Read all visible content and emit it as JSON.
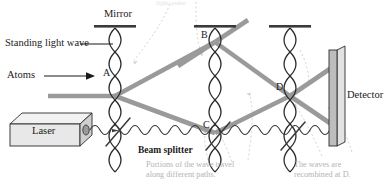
{
  "figure": {
    "kind": "atom-interferometer-diagram",
    "top_caption_partial": "light-pulse",
    "labels": {
      "mirror": "Mirror",
      "standing_light_wave": "Standing light wave",
      "atoms": "Atoms",
      "laser": "Laser",
      "beam_splitter": "Beam splitter",
      "detector": "Detector",
      "point_a": "A",
      "point_b": "B",
      "point_c": "C",
      "point_d": "D"
    },
    "captions": {
      "left": "Portions of the wave travel\nalong different paths.",
      "left_line1": "Portions of the wave travel",
      "left_line2": "along different paths.",
      "right": "The waves are\nrecombined at D.",
      "right_line1": "The waves are",
      "right_line2": "recombined at D."
    },
    "colors": {
      "atom_beam": "#9a9a9a",
      "standing_wave": "#2b2b2b",
      "mirror_bar": "#3a3a3a",
      "laser_wave": "#3a3a3a",
      "detector_fill": "#bdbdbd",
      "laser_fill": "#e8e8e8",
      "caption_gray": "#b3b3b3",
      "leader_gray": "#cfcfcf",
      "text": "#1a1a1a"
    },
    "geometry": {
      "standing_wave_x": [
        115,
        215,
        290,
        378
      ],
      "mirror_x": [
        115,
        215,
        290
      ],
      "point_a": [
        115,
        96
      ],
      "point_b": [
        215,
        42
      ],
      "point_c": [
        215,
        133
      ],
      "point_d": [
        290,
        96
      ],
      "detector_x": 340
    }
  }
}
